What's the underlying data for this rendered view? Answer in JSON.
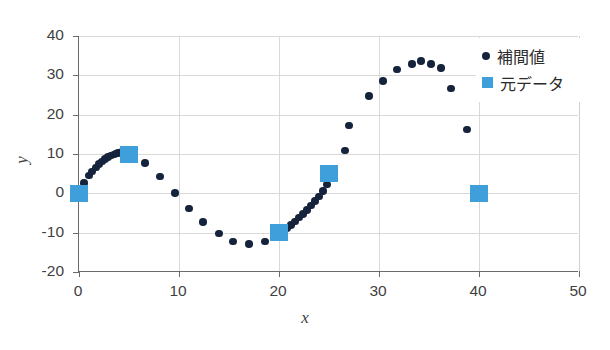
{
  "chart_data": {
    "type": "scatter",
    "title": "",
    "xlabel": "x",
    "ylabel": "y",
    "xlim": [
      0,
      50
    ],
    "ylim": [
      -20,
      40
    ],
    "xticks": [
      0,
      10,
      20,
      30,
      40,
      50
    ],
    "yticks": [
      -20,
      -10,
      0,
      10,
      20,
      30,
      40
    ],
    "grid": true,
    "legend_position": "top-right",
    "series": [
      {
        "name": "補間値",
        "marker": "circle",
        "color": "#16233c",
        "points": [
          [
            0.0,
            0.3
          ],
          [
            0.5,
            2.6
          ],
          [
            1.0,
            4.5
          ],
          [
            1.3,
            5.5
          ],
          [
            1.7,
            6.6
          ],
          [
            2.0,
            7.4
          ],
          [
            2.3,
            8.1
          ],
          [
            2.6,
            8.7
          ],
          [
            2.9,
            9.2
          ],
          [
            3.2,
            9.6
          ],
          [
            3.5,
            9.9
          ],
          [
            3.7,
            10.1
          ],
          [
            3.9,
            10.3
          ],
          [
            4.1,
            10.4
          ],
          [
            4.3,
            10.5
          ],
          [
            4.5,
            10.5
          ],
          [
            4.7,
            10.5
          ],
          [
            4.9,
            10.4
          ],
          [
            6.6,
            7.7
          ],
          [
            8.1,
            4.3
          ],
          [
            9.6,
            0.1
          ],
          [
            11.0,
            -3.8
          ],
          [
            12.4,
            -7.3
          ],
          [
            14.0,
            -10.2
          ],
          [
            15.4,
            -12.2
          ],
          [
            17.0,
            -12.9
          ],
          [
            18.6,
            -12.2
          ],
          [
            20.0,
            -10.4
          ],
          [
            20.4,
            -9.6
          ],
          [
            20.8,
            -8.8
          ],
          [
            21.2,
            -8.0
          ],
          [
            21.6,
            -7.1
          ],
          [
            22.0,
            -6.2
          ],
          [
            22.4,
            -5.2
          ],
          [
            22.8,
            -4.2
          ],
          [
            23.2,
            -3.1
          ],
          [
            23.6,
            -2.0
          ],
          [
            24.0,
            -0.8
          ],
          [
            24.4,
            0.6
          ],
          [
            24.8,
            2.2
          ],
          [
            25.2,
            3.9
          ],
          [
            26.6,
            10.9
          ],
          [
            27.0,
            17.3
          ],
          [
            29.0,
            24.8
          ],
          [
            30.4,
            28.6
          ],
          [
            31.8,
            31.5
          ],
          [
            33.3,
            32.9
          ],
          [
            34.2,
            33.6
          ],
          [
            35.2,
            32.9
          ],
          [
            36.2,
            31.9
          ],
          [
            37.2,
            26.6
          ],
          [
            38.8,
            16.2
          ]
        ]
      },
      {
        "name": "元データ",
        "marker": "square",
        "color": "#3f9fdb",
        "points": [
          [
            0,
            0
          ],
          [
            5,
            10
          ],
          [
            20,
            -10
          ],
          [
            25,
            5
          ],
          [
            40,
            0
          ]
        ]
      }
    ]
  },
  "legend": {
    "items": [
      {
        "label": "補間値",
        "marker": "circle-marker-icon"
      },
      {
        "label": "元データ",
        "marker": "square-marker-icon"
      }
    ]
  },
  "axes": {
    "x_title": "x",
    "y_title": "y",
    "x_tick_labels": [
      "0",
      "10",
      "20",
      "30",
      "40",
      "50"
    ],
    "y_tick_labels": [
      "40",
      "30",
      "20",
      "10",
      "0",
      "-10",
      "-20"
    ]
  },
  "colors": {
    "interp_marker": "#16233c",
    "orig_marker": "#3f9fdb",
    "axis_line": "#6a6a6a",
    "gridline": "#d9d9d9",
    "background": "#ffffff"
  }
}
